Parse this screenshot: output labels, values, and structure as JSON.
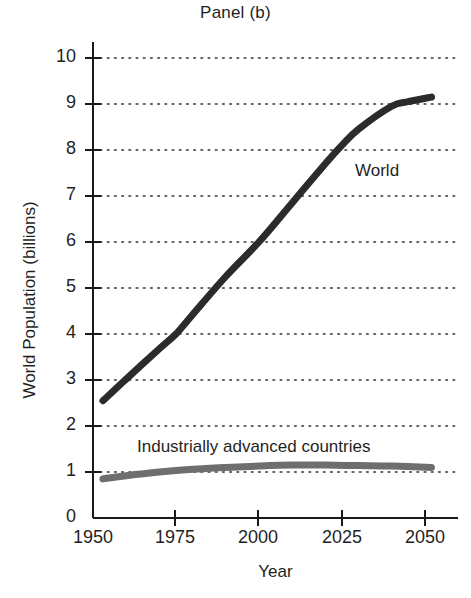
{
  "chart_data": {
    "type": "line",
    "title": "Panel (b)",
    "xlabel": "Year",
    "ylabel": "World Population (billions)",
    "xlim": [
      1950,
      2060
    ],
    "ylim": [
      0,
      10
    ],
    "xticks": [
      1950,
      1975,
      2000,
      2025,
      2050
    ],
    "xtick_labels": [
      "1950",
      "1975",
      "2000",
      "2025",
      "2050"
    ],
    "yticks": [
      0,
      1,
      2,
      3,
      4,
      5,
      6,
      7,
      8,
      9,
      10
    ],
    "ytick_labels": [
      "0",
      "1",
      "2",
      "3",
      "4",
      "5",
      "6",
      "7",
      "8",
      "9",
      "10"
    ],
    "grid": "horizontal-dotted",
    "legend": "inline-annotations",
    "series": [
      {
        "name": "World",
        "color": "#2b2b2b",
        "label_text": "World",
        "x": [
          1953,
          1960,
          1970,
          1975,
          1980,
          1990,
          2000,
          2010,
          2020,
          2025,
          2030,
          2040,
          2045,
          2052
        ],
        "values": [
          2.55,
          3.02,
          3.68,
          4.0,
          4.42,
          5.25,
          6.0,
          6.85,
          7.7,
          8.1,
          8.45,
          8.95,
          9.05,
          9.15
        ]
      },
      {
        "name": "Industrially advanced countries",
        "color": "#6e6e6e",
        "label_text": "Industrially advanced countries",
        "x": [
          1953,
          1960,
          1970,
          1980,
          1990,
          2000,
          2010,
          2020,
          2030,
          2040,
          2052
        ],
        "values": [
          0.85,
          0.92,
          1.0,
          1.06,
          1.1,
          1.13,
          1.15,
          1.15,
          1.14,
          1.13,
          1.1
        ]
      }
    ]
  },
  "annotations": {
    "world_label": "World",
    "advanced_label": "Industrially advanced countries"
  }
}
